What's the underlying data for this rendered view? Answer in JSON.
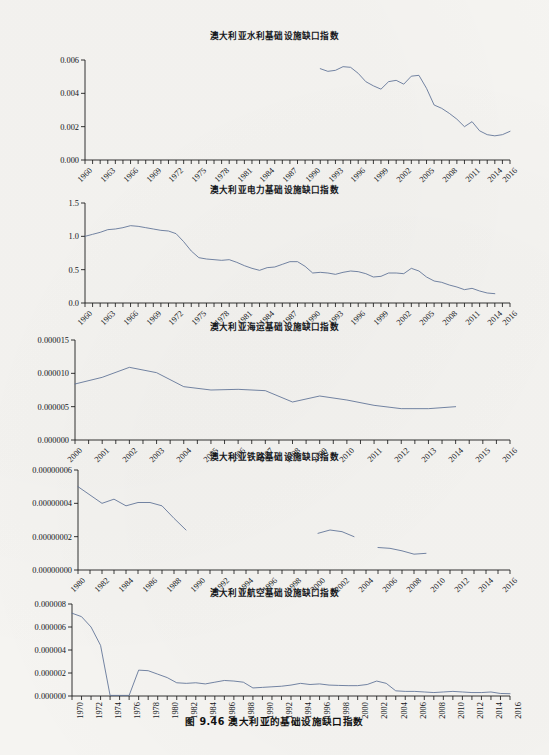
{
  "figure": {
    "caption": "图 9.46    澳大利亚的基础设施缺口指数",
    "line_color": "#5b6f94",
    "axis_color": "#1c1c1c",
    "background": "#f5f4f1"
  },
  "panels": [
    {
      "id": "water",
      "title": "澳大利亚水利基础设施缺口指数",
      "ylabels": [
        "0.000",
        "0.002",
        "0.004",
        "0.006"
      ],
      "xlabels": [
        "1960",
        "1963",
        "1966",
        "1969",
        "1972",
        "1975",
        "1978",
        "1981",
        "1984",
        "1987",
        "1990",
        "1993",
        "1996",
        "1999",
        "2002",
        "2005",
        "2008",
        "2011",
        "2014",
        "2016"
      ]
    },
    {
      "id": "electricity",
      "title": "澳大利亚电力基础设施缺口指数",
      "ylabels": [
        "0.0",
        "0.5",
        "1.0",
        "1.5"
      ],
      "xlabels": [
        "1960",
        "1963",
        "1966",
        "1969",
        "1972",
        "1975",
        "1978",
        "1981",
        "1984",
        "1987",
        "1990",
        "1993",
        "1996",
        "1999",
        "2002",
        "2005",
        "2008",
        "2011",
        "2014",
        "2016"
      ]
    },
    {
      "id": "maritime",
      "title": "澳大利亚海运基础设施缺口指数",
      "ylabels": [
        "0.000000",
        "0.000005",
        "0.000010",
        "0.000015"
      ],
      "xlabels": [
        "2000",
        "2001",
        "2002",
        "2003",
        "2004",
        "2005",
        "2006",
        "2007",
        "2008",
        "2009",
        "2010",
        "2011",
        "2012",
        "2013",
        "2014",
        "2015",
        "2016"
      ]
    },
    {
      "id": "railway",
      "title": "澳大利亚铁路基础设施缺口指数",
      "ylabels": [
        "0.00000000",
        "0.00000002",
        "0.00000004",
        "0.00000006"
      ],
      "xlabels": [
        "1980",
        "1982",
        "1984",
        "1986",
        "1988",
        "1990",
        "1992",
        "1994",
        "1996",
        "1998",
        "2000",
        "2002",
        "2004",
        "2006",
        "2008",
        "2010",
        "2012",
        "2014",
        "2016"
      ]
    },
    {
      "id": "aviation",
      "title": "澳大利亚航空基础设施缺口指数",
      "ylabels": [
        "0.000000",
        "0.000002",
        "0.000004",
        "0.000006",
        "0.000008"
      ],
      "xlabels": [
        "1970",
        "1972",
        "1974",
        "1976",
        "1978",
        "1980",
        "1982",
        "1984",
        "1986",
        "1988",
        "1990",
        "1992",
        "1994",
        "1996",
        "1998",
        "2000",
        "2002",
        "2004",
        "2006",
        "2008",
        "2010",
        "2012",
        "2014",
        "2016"
      ]
    }
  ],
  "chart_data": [
    {
      "type": "line",
      "id": "water",
      "title": "澳大利亚水利基础设施缺口指数",
      "xlabel": "",
      "ylabel": "",
      "xlim": [
        1960,
        2016
      ],
      "ylim": [
        0,
        0.006
      ],
      "yticks": [
        0,
        0.002,
        0.004,
        0.006
      ],
      "xticks": [
        1960,
        1963,
        1966,
        1969,
        1972,
        1975,
        1978,
        1981,
        1984,
        1987,
        1990,
        1993,
        1996,
        1999,
        2002,
        2005,
        2008,
        2011,
        2014,
        2016
      ],
      "minor_xtick_step": 1,
      "grid": false,
      "legend": "none",
      "x": [
        1991,
        1992,
        1993,
        1994,
        1995,
        1996,
        1997,
        1998,
        1999,
        2000,
        2001,
        2002,
        2003,
        2004,
        2005,
        2006,
        2007,
        2008,
        2009,
        2010,
        2011,
        2012,
        2013,
        2014,
        2015,
        2016
      ],
      "values": [
        0.00548,
        0.00532,
        0.00538,
        0.0056,
        0.00556,
        0.0052,
        0.0047,
        0.00445,
        0.00425,
        0.0047,
        0.00478,
        0.00455,
        0.00503,
        0.00508,
        0.0043,
        0.0033,
        0.0031,
        0.0028,
        0.00245,
        0.002,
        0.0023,
        0.00175,
        0.00152,
        0.00145,
        0.00152,
        0.00172
      ]
    },
    {
      "type": "line",
      "id": "electricity",
      "title": "澳大利亚电力基础设施缺口指数",
      "xlabel": "",
      "ylabel": "",
      "xlim": [
        1960,
        2016
      ],
      "ylim": [
        0,
        1.5
      ],
      "yticks": [
        0.0,
        0.5,
        1.0,
        1.5
      ],
      "xticks": [
        1960,
        1963,
        1966,
        1969,
        1972,
        1975,
        1978,
        1981,
        1984,
        1987,
        1990,
        1993,
        1996,
        1999,
        2002,
        2005,
        2008,
        2011,
        2014,
        2016
      ],
      "minor_xtick_step": 1,
      "grid": false,
      "legend": "none",
      "x": [
        1960,
        1961,
        1962,
        1963,
        1964,
        1965,
        1966,
        1967,
        1968,
        1969,
        1970,
        1971,
        1972,
        1973,
        1974,
        1975,
        1976,
        1977,
        1978,
        1979,
        1980,
        1981,
        1982,
        1983,
        1984,
        1985,
        1986,
        1987,
        1988,
        1989,
        1990,
        1991,
        1992,
        1993,
        1994,
        1995,
        1996,
        1997,
        1998,
        1999,
        2000,
        2001,
        2002,
        2003,
        2004,
        2005,
        2006,
        2007,
        2008,
        2009,
        2010,
        2011,
        2012,
        2013,
        2014
      ],
      "values": [
        1.0,
        1.03,
        1.06,
        1.1,
        1.11,
        1.13,
        1.16,
        1.15,
        1.13,
        1.11,
        1.09,
        1.08,
        1.04,
        0.92,
        0.78,
        0.68,
        0.66,
        0.65,
        0.64,
        0.65,
        0.61,
        0.56,
        0.52,
        0.49,
        0.53,
        0.54,
        0.58,
        0.62,
        0.62,
        0.55,
        0.45,
        0.46,
        0.45,
        0.43,
        0.46,
        0.48,
        0.47,
        0.44,
        0.39,
        0.4,
        0.45,
        0.45,
        0.44,
        0.52,
        0.48,
        0.39,
        0.33,
        0.31,
        0.27,
        0.24,
        0.2,
        0.22,
        0.18,
        0.15,
        0.14
      ]
    },
    {
      "type": "line",
      "id": "maritime",
      "title": "澳大利亚海运基础设施缺口指数",
      "xlabel": "",
      "ylabel": "",
      "xlim": [
        2000,
        2016
      ],
      "ylim": [
        0,
        1.5e-05
      ],
      "yticks": [
        0,
        5e-06,
        1e-05,
        1.5e-05
      ],
      "xticks": [
        2000,
        2001,
        2002,
        2003,
        2004,
        2005,
        2006,
        2007,
        2008,
        2009,
        2010,
        2011,
        2012,
        2013,
        2014,
        2015,
        2016
      ],
      "minor_xtick_step": 0.5,
      "grid": false,
      "legend": "none",
      "x": [
        2000,
        2001,
        2002,
        2003,
        2004,
        2005,
        2006,
        2007,
        2008,
        2009,
        2010,
        2011,
        2012,
        2013,
        2014
      ],
      "values": [
        8.4e-06,
        9.4e-06,
        1.09e-05,
        1.01e-05,
        8e-06,
        7.5e-06,
        7.6e-06,
        7.4e-06,
        5.7e-06,
        6.6e-06,
        6e-06,
        5.2e-06,
        4.7e-06,
        4.7e-06,
        5e-06
      ]
    },
    {
      "type": "line",
      "id": "railway",
      "title": "澳大利亚铁路基础设施缺口指数",
      "xlabel": "",
      "ylabel": "",
      "xlim": [
        1980,
        2016
      ],
      "ylim": [
        0,
        6e-08
      ],
      "yticks": [
        0,
        2e-08,
        4e-08,
        6e-08
      ],
      "xticks": [
        1980,
        1982,
        1984,
        1986,
        1988,
        1990,
        1992,
        1994,
        1996,
        1998,
        2000,
        2002,
        2004,
        2006,
        2008,
        2010,
        2012,
        2014,
        2016
      ],
      "minor_xtick_step": 1,
      "grid": false,
      "legend": "none",
      "segments": [
        {
          "x": [
            1980,
            1981,
            1982,
            1983,
            1984,
            1985,
            1986,
            1987,
            1988,
            1989
          ],
          "values": [
            5e-08,
            4.5e-08,
            4e-08,
            4.25e-08,
            3.85e-08,
            4.05e-08,
            4.05e-08,
            3.85e-08,
            3.1e-08,
            2.4e-08
          ]
        },
        {
          "x": [
            2000,
            2001,
            2002,
            2003
          ],
          "values": [
            2.2e-08,
            2.4e-08,
            2.3e-08,
            2e-08
          ]
        },
        {
          "x": [
            2005,
            2006,
            2007,
            2008,
            2009
          ],
          "values": [
            1.35e-08,
            1.3e-08,
            1.15e-08,
            9.5e-09,
            1e-08
          ]
        }
      ]
    },
    {
      "type": "line",
      "id": "aviation",
      "title": "澳大利亚航空基础设施缺口指数",
      "xlabel": "",
      "ylabel": "",
      "xlim": [
        1970,
        2016
      ],
      "ylim": [
        0,
        8e-06
      ],
      "yticks": [
        0,
        2e-06,
        4e-06,
        6e-06,
        8e-06
      ],
      "xticks": [
        1970,
        1972,
        1974,
        1976,
        1978,
        1980,
        1982,
        1984,
        1986,
        1988,
        1990,
        1992,
        1994,
        1996,
        1998,
        2000,
        2002,
        2004,
        2006,
        2008,
        2010,
        2012,
        2014,
        2016
      ],
      "minor_xtick_step": 1,
      "grid": false,
      "legend": "none",
      "x": [
        1970,
        1971,
        1972,
        1973,
        1974,
        1975,
        1976,
        1977,
        1978,
        1979,
        1980,
        1981,
        1982,
        1983,
        1984,
        1985,
        1986,
        1987,
        1988,
        1989,
        1990,
        1991,
        1992,
        1993,
        1994,
        1995,
        1996,
        1997,
        1998,
        1999,
        2000,
        2001,
        2002,
        2003,
        2004,
        2005,
        2006,
        2007,
        2008,
        2009,
        2010,
        2011,
        2012,
        2013,
        2014,
        2015,
        2016
      ],
      "values": [
        7.2e-06,
        6.9e-06,
        6e-06,
        4.4e-06,
        5e-08,
        5e-08,
        5e-08,
        2.25e-06,
        2.2e-06,
        1.9e-06,
        1.6e-06,
        1.15e-06,
        1.1e-06,
        1.15e-06,
        1.05e-06,
        1.2e-06,
        1.35e-06,
        1.3e-06,
        1.2e-06,
        7e-07,
        7.5e-07,
        8e-07,
        8.5e-07,
        9.5e-07,
        1.1e-06,
        1e-06,
        1.05e-06,
        9.5e-07,
        9.2e-07,
        9e-07,
        9e-07,
        1e-06,
        1.3e-06,
        1.1e-06,
        4.5e-07,
        4e-07,
        4e-07,
        3.5e-07,
        3e-07,
        3.5e-07,
        4e-07,
        3.5e-07,
        3e-07,
        3e-07,
        3.5e-07,
        2.2e-07,
        2e-07
      ]
    }
  ]
}
